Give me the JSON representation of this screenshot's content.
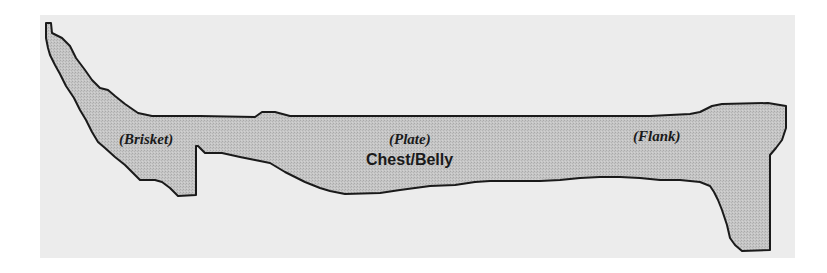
{
  "figure": {
    "region_name": "Chest/Belly",
    "sub_regions": [
      {
        "label": "(Brisket)"
      },
      {
        "label": "(Plate)"
      },
      {
        "label": "(Flank)"
      }
    ],
    "colors": {
      "background": "#ffffff",
      "panel": "#ececec",
      "region_fill": "#c4c4c4",
      "outline": "#1a1a1a"
    }
  }
}
